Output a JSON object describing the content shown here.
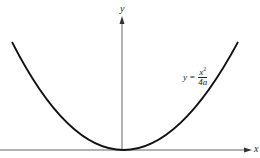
{
  "diagram": {
    "axes": {
      "x_label": "x",
      "y_label": "y"
    },
    "equation": {
      "lhs": "y =",
      "numerator": "x",
      "numerator_exp": "2",
      "denominator": "4a"
    },
    "curve": {
      "type": "parabola",
      "vertex": "origin",
      "opens": "upward"
    },
    "colors": {
      "curve": "#111111",
      "axes": "#555555",
      "background": "#ffffff"
    }
  }
}
